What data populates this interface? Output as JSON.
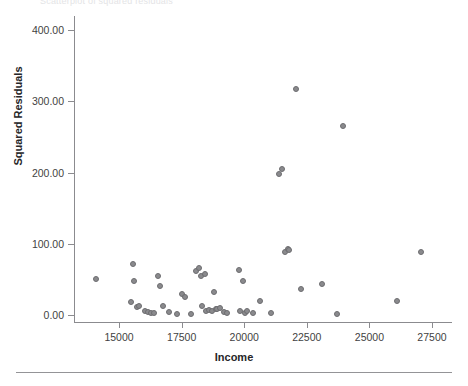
{
  "figure": {
    "top_caption": "Scatterplot of squared residuals"
  },
  "axes": {
    "x_title": "Income",
    "y_title": "Squared Residuals",
    "x_ticks": [
      "15000",
      "17500",
      "20000",
      "22500",
      "25000",
      "27500"
    ],
    "y_ticks": [
      "0.00",
      "100.00",
      "200.00",
      "300.00",
      "400.00"
    ]
  },
  "chart_data": {
    "type": "scatter",
    "title": "",
    "xlabel": "Income",
    "ylabel": "Squared Residuals",
    "xlim": [
      13200,
      28300
    ],
    "ylim": [
      -10,
      420
    ],
    "xticks": [
      15000,
      17500,
      20000,
      22500,
      25000,
      27500
    ],
    "yticks": [
      0,
      100,
      200,
      300,
      400
    ],
    "grid": false,
    "legend": null,
    "marker": {
      "shape": "circle",
      "fill": "#8a8a8d",
      "edge": "#6d6d70",
      "size_px": 6
    },
    "series": [
      {
        "name": "Squared residuals",
        "points": [
          [
            14080,
            50
          ],
          [
            15490,
            18
          ],
          [
            15560,
            72
          ],
          [
            15610,
            48
          ],
          [
            15720,
            11
          ],
          [
            15810,
            12
          ],
          [
            16020,
            6
          ],
          [
            16160,
            4
          ],
          [
            16290,
            2
          ],
          [
            16400,
            2
          ],
          [
            16540,
            55
          ],
          [
            16620,
            41
          ],
          [
            16740,
            12
          ],
          [
            17010,
            4
          ],
          [
            17320,
            1
          ],
          [
            17520,
            30
          ],
          [
            17640,
            25
          ],
          [
            17880,
            1
          ],
          [
            18060,
            62
          ],
          [
            18180,
            66
          ],
          [
            18260,
            55
          ],
          [
            18300,
            12
          ],
          [
            18420,
            57
          ],
          [
            18470,
            6
          ],
          [
            18600,
            7
          ],
          [
            18720,
            6
          ],
          [
            18810,
            32
          ],
          [
            18860,
            8
          ],
          [
            18930,
            8
          ],
          [
            19020,
            9
          ],
          [
            19180,
            4
          ],
          [
            19320,
            2
          ],
          [
            19780,
            63
          ],
          [
            19840,
            6
          ],
          [
            19950,
            47
          ],
          [
            20040,
            3
          ],
          [
            20120,
            5
          ],
          [
            20350,
            2
          ],
          [
            20640,
            20
          ],
          [
            21060,
            3
          ],
          [
            21380,
            198
          ],
          [
            21520,
            205
          ],
          [
            21640,
            88
          ],
          [
            21740,
            92
          ],
          [
            21790,
            91
          ],
          [
            22060,
            318
          ],
          [
            22260,
            36
          ],
          [
            23100,
            44
          ],
          [
            23700,
            1
          ],
          [
            23960,
            265
          ],
          [
            26120,
            19
          ],
          [
            27050,
            89
          ]
        ]
      }
    ]
  }
}
